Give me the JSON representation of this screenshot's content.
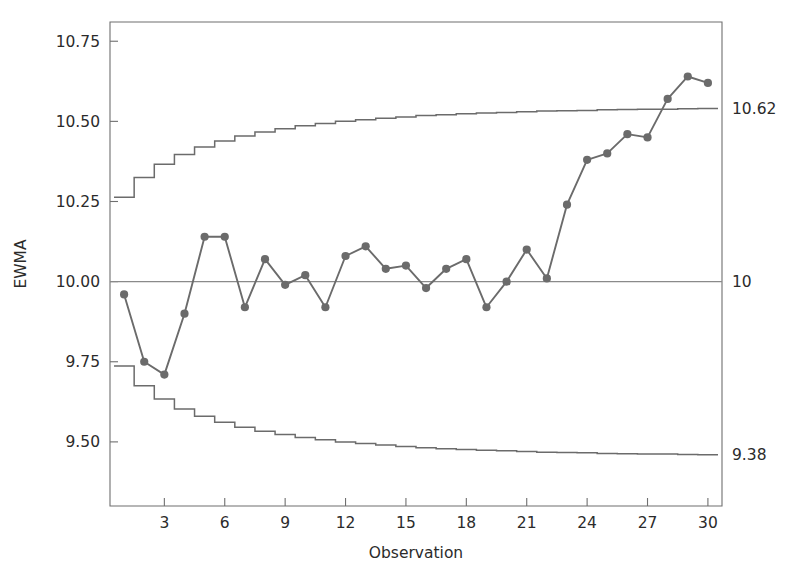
{
  "chart_data": {
    "type": "line",
    "title": "",
    "xlabel": "Observation",
    "ylabel": "EWMA",
    "xlim": [
      0.3,
      30.7
    ],
    "ylim": [
      9.3,
      10.81
    ],
    "grid": false,
    "legend": null,
    "x": [
      1,
      2,
      3,
      4,
      5,
      6,
      7,
      8,
      9,
      10,
      11,
      12,
      13,
      14,
      15,
      16,
      17,
      18,
      19,
      20,
      21,
      22,
      23,
      24,
      25,
      26,
      27,
      28,
      29,
      30
    ],
    "series": [
      {
        "name": "EWMA",
        "marker": "circle",
        "color": "#6b6b6b",
        "values": [
          9.96,
          9.75,
          9.71,
          9.9,
          10.14,
          10.14,
          9.92,
          10.07,
          9.99,
          10.02,
          9.92,
          10.08,
          10.11,
          10.04,
          10.05,
          9.98,
          10.04,
          10.07,
          9.92,
          10.0,
          10.1,
          10.01,
          10.24,
          10.38,
          10.4,
          10.46,
          10.45,
          10.57,
          10.64,
          10.62
        ]
      },
      {
        "name": "UCL",
        "marker": "none",
        "color": "#6b6b6b",
        "step": "post",
        "values": [
          10.263,
          10.325,
          10.366,
          10.397,
          10.42,
          10.439,
          10.454,
          10.467,
          10.477,
          10.486,
          10.493,
          10.5,
          10.505,
          10.51,
          10.514,
          10.518,
          10.521,
          10.524,
          10.526,
          10.528,
          10.53,
          10.532,
          10.533,
          10.534,
          10.536,
          10.537,
          10.538,
          10.538,
          10.539,
          10.54
        ]
      },
      {
        "name": "LCL",
        "marker": "none",
        "color": "#6b6b6b",
        "step": "post",
        "values": [
          9.737,
          9.675,
          9.634,
          9.603,
          9.58,
          9.561,
          9.546,
          9.533,
          9.523,
          9.514,
          9.507,
          9.5,
          9.495,
          9.49,
          9.486,
          9.482,
          9.479,
          9.476,
          9.474,
          9.472,
          9.47,
          9.468,
          9.467,
          9.466,
          9.464,
          9.463,
          9.462,
          9.462,
          9.461,
          9.46
        ]
      }
    ],
    "center_line": 10,
    "yticks": [
      9.5,
      9.75,
      10.0,
      10.25,
      10.5,
      10.75
    ],
    "ytick_labels": [
      "9.50",
      "9.75",
      "10.00",
      "10.25",
      "10.50",
      "10.75"
    ],
    "xticks": [
      3,
      6,
      9,
      12,
      15,
      18,
      21,
      24,
      27,
      30
    ],
    "xtick_labels": [
      "3",
      "6",
      "9",
      "12",
      "15",
      "18",
      "21",
      "24",
      "27",
      "30"
    ],
    "right_labels": [
      {
        "name": "ucl-value",
        "text": "10.62",
        "y": 10.54
      },
      {
        "name": "center-value",
        "text": "10",
        "y": 10.0
      },
      {
        "name": "lcl-value",
        "text": "9.38",
        "y": 9.46
      }
    ],
    "colors": {
      "series": "#6b6b6b",
      "limits": "#6b6b6b",
      "center": "#8a8a8a",
      "axis": "#6f6f6f",
      "text": "#2b2b2b",
      "background": "#ffffff"
    }
  }
}
